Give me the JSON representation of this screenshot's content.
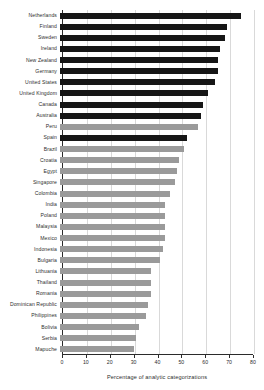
{
  "chart_data": {
    "type": "bar",
    "orientation": "horizontal",
    "title": "",
    "xlabel": "Percentage of analytic categorizations",
    "ylabel": "",
    "xlim": [
      0,
      80
    ],
    "xticks": [
      0,
      10,
      20,
      30,
      40,
      50,
      60,
      70,
      80
    ],
    "grid": true,
    "grid_axis": "x",
    "legend": null,
    "colors": {
      "highlight": "#161616",
      "muted": "#9a9a9a",
      "axis": "#2b2b2b",
      "grid": "#d9d9d9",
      "background": "#ffffff",
      "text": "#2e2e2e"
    },
    "categories": [
      "Netherlands",
      "Finland",
      "Sweden",
      "Ireland",
      "New Zealand",
      "Germany",
      "United States",
      "United Kingdom",
      "Canada",
      "Australia",
      "Peru",
      "Spain",
      "Brazil",
      "Croatia",
      "Egypt",
      "Singapore",
      "Colombia",
      "India",
      "Poland",
      "Malaysia",
      "Mexico",
      "Indonesia",
      "Bulgaria",
      "Lithuania",
      "Thailand",
      "Romania",
      "Dominican Republic",
      "Philippines",
      "Bolivia",
      "Serbia",
      "Mapuche"
    ],
    "values": [
      76,
      70,
      69,
      67,
      66,
      66,
      65,
      62,
      60,
      59,
      58,
      53,
      52,
      50,
      49,
      48,
      46,
      44,
      44,
      44,
      44,
      43,
      42,
      38,
      38,
      38,
      37,
      36,
      33,
      32,
      31
    ],
    "bar_styles": [
      "highlight",
      "highlight",
      "highlight",
      "highlight",
      "highlight",
      "highlight",
      "highlight",
      "highlight",
      "highlight",
      "highlight",
      "muted",
      "highlight",
      "muted",
      "muted",
      "muted",
      "muted",
      "muted",
      "muted",
      "muted",
      "muted",
      "muted",
      "muted",
      "muted",
      "muted",
      "muted",
      "muted",
      "muted",
      "muted",
      "muted",
      "muted",
      "muted"
    ]
  }
}
